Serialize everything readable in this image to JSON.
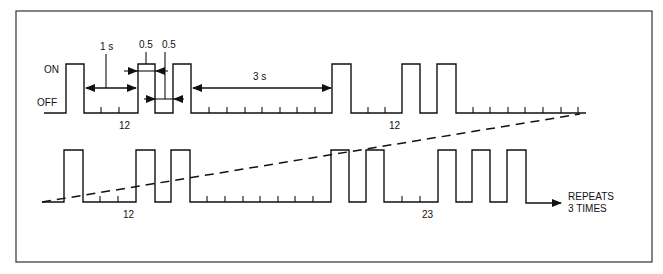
{
  "diagram": {
    "type": "timing-diagram",
    "state_labels": {
      "on": "ON",
      "off": "OFF"
    },
    "dimensions": {
      "gap_1s": "1 s",
      "pulse_width": "0.5",
      "low_width": "0.5",
      "gap_3s": "3 s"
    },
    "row1": {
      "group_labels": [
        "12",
        "12"
      ],
      "pulses": [
        [
          66,
          84
        ],
        [
          138,
          155
        ],
        [
          173,
          191
        ],
        [
          332,
          351
        ],
        [
          402,
          420
        ],
        [
          437,
          456
        ]
      ],
      "ticks": [
        101,
        119,
        209,
        227,
        245,
        262,
        280,
        297,
        315,
        368,
        385,
        473,
        490,
        508,
        525,
        543,
        561,
        578
      ],
      "end_x": 586
    },
    "row2": {
      "group_labels": [
        "12",
        "23"
      ],
      "pulses": [
        [
          64,
          83
        ],
        [
          136,
          155
        ],
        [
          171,
          190
        ],
        [
          331,
          349
        ],
        [
          366,
          384
        ],
        [
          438,
          456
        ],
        [
          472,
          490
        ],
        [
          507,
          526
        ]
      ],
      "ticks": [
        100,
        118,
        207,
        225,
        243,
        260,
        278,
        295,
        313,
        402,
        420
      ],
      "end_note_line1": "REPEATS",
      "end_note_line2": "3 TIMES"
    }
  }
}
